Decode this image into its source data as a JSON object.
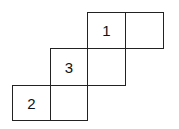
{
  "cells": [
    {
      "label": "1",
      "x": 87,
      "y": 12,
      "w": 39,
      "h": 37
    },
    {
      "label": "",
      "x": 125,
      "y": 12,
      "w": 39,
      "h": 37
    },
    {
      "label": "3",
      "x": 50,
      "y": 48,
      "w": 38,
      "h": 38
    },
    {
      "label": "",
      "x": 87,
      "y": 48,
      "w": 39,
      "h": 38
    },
    {
      "label": "2",
      "x": 12,
      "y": 85,
      "w": 39,
      "h": 36
    },
    {
      "label": "",
      "x": 50,
      "y": 85,
      "w": 38,
      "h": 36
    }
  ]
}
